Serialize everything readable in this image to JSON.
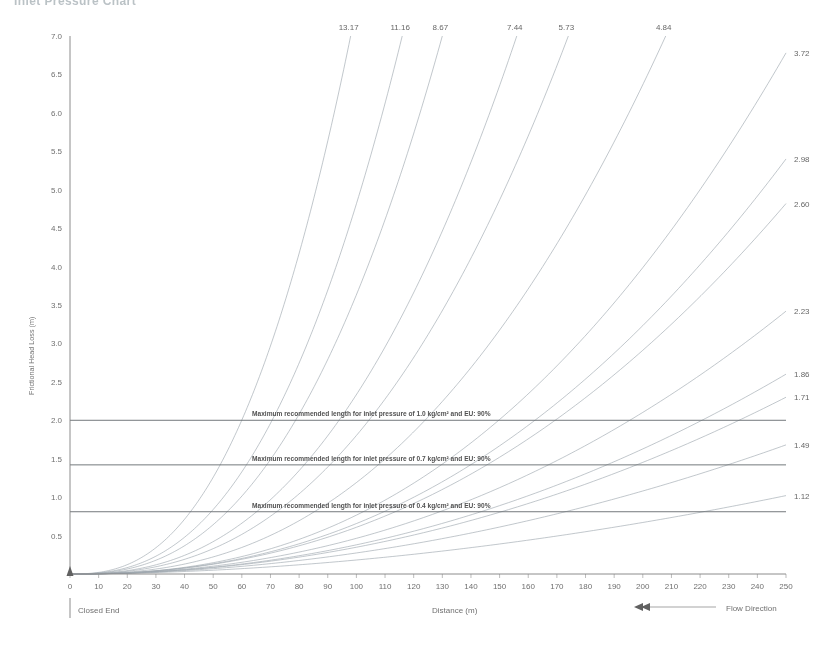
{
  "document": {
    "title": "Inlet Pressure Chart"
  },
  "footer": {
    "closed_end": "Closed End",
    "x_axis_caption": "Distance (m)",
    "flow_direction": "Flow Direction",
    "flow_arrow_icon": "arrow-left-icon"
  },
  "chart_data": {
    "type": "line",
    "title": "",
    "xlabel": "Distance (m)",
    "ylabel": "Frictional Head Loss (m)",
    "xlim": [
      0,
      250
    ],
    "ylim": [
      0,
      7.0
    ],
    "xticks": [
      0,
      10,
      20,
      30,
      40,
      50,
      60,
      70,
      80,
      90,
      100,
      110,
      120,
      130,
      140,
      150,
      160,
      170,
      180,
      190,
      200,
      210,
      220,
      230,
      240,
      250
    ],
    "yticks": [
      0.5,
      1.0,
      1.5,
      2.0,
      2.5,
      3.0,
      3.5,
      4.0,
      4.5,
      5.0,
      5.5,
      6.0,
      6.5,
      7.0
    ],
    "grid": false,
    "legend": "none",
    "series_label_note": "Each curve is labelled with its flow rate value at the point it exits the plot area",
    "series": [
      {
        "name": "13.17",
        "label": "13.17",
        "label_side": "top",
        "exit_x": 98,
        "exponent": 2.55
      },
      {
        "name": "11.16",
        "label": "11.16",
        "label_side": "top",
        "exit_x": 116,
        "exponent": 2.52
      },
      {
        "name": "8.67",
        "label": "8.67",
        "label_side": "top",
        "exit_x": 130,
        "exponent": 2.5
      },
      {
        "name": "7.44",
        "label": "7.44",
        "label_side": "top",
        "exit_x": 156,
        "exponent": 2.47
      },
      {
        "name": "5.73",
        "label": "5.73",
        "label_side": "top",
        "exit_x": 174,
        "exponent": 2.45
      },
      {
        "name": "4.84",
        "label": "4.84",
        "label_side": "top",
        "exit_x": 208,
        "exponent": 2.42
      },
      {
        "name": "3.72",
        "label": "3.72",
        "label_side": "right",
        "exit_y": 6.78,
        "exponent": 2.38
      },
      {
        "name": "2.98",
        "label": "2.98",
        "label_side": "right",
        "exit_y": 5.4,
        "exponent": 2.3
      },
      {
        "name": "2.60",
        "label": "2.60",
        "label_side": "right",
        "exit_y": 4.82,
        "exponent": 2.26
      },
      {
        "name": "2.23",
        "label": "2.23",
        "label_side": "right",
        "exit_y": 3.42,
        "exponent": 2.18
      },
      {
        "name": "1.86",
        "label": "1.86",
        "label_side": "right",
        "exit_y": 2.6,
        "exponent": 2.1
      },
      {
        "name": "1.71",
        "label": "1.71",
        "label_side": "right",
        "exit_y": 2.3,
        "exponent": 2.06
      },
      {
        "name": "1.49",
        "label": "1.49",
        "label_side": "right",
        "exit_y": 1.68,
        "exponent": 1.98
      },
      {
        "name": "1.12",
        "label": "1.12",
        "label_side": "right",
        "exit_y": 1.02,
        "exponent": 1.88
      }
    ],
    "reference_lines": [
      {
        "y": 2.0,
        "label": "Maximum recommended length for inlet pressure of 1.0 kg/cm² and EU: 90%",
        "pressure": "1.0 kg/cm²",
        "eu": "90%"
      },
      {
        "y": 1.42,
        "label": "Maximum recommended length for inlet pressure of 0.7 kg/cm² and EU: 90%",
        "pressure": "0.7 kg/cm²",
        "eu": "90%"
      },
      {
        "y": 0.81,
        "label": "Maximum recommended length for inlet pressure of 0.4 kg/cm² and EU: 90%",
        "pressure": "0.4 kg/cm²",
        "eu": "90%"
      }
    ]
  }
}
